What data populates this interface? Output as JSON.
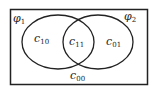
{
  "diagram": {
    "type": "venn",
    "sets": [
      {
        "name": "phi1",
        "symbol": "φ",
        "subscript": "1"
      },
      {
        "name": "phi2",
        "symbol": "φ",
        "subscript": "2"
      }
    ],
    "regions": [
      {
        "id": "c10",
        "base": "c",
        "subscript": "10",
        "location": "phi1 only"
      },
      {
        "id": "c11",
        "base": "c",
        "subscript": "11",
        "location": "intersection"
      },
      {
        "id": "c01",
        "base": "c",
        "subscript": "01",
        "location": "phi2 only"
      },
      {
        "id": "c00",
        "base": "c",
        "subscript": "00",
        "location": "outside both"
      }
    ],
    "colors": {
      "stroke": "#222222",
      "background": "#ffffff"
    }
  }
}
